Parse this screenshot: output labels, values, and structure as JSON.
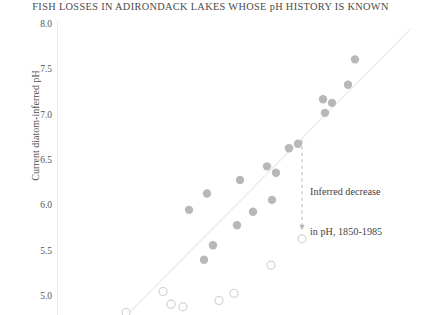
{
  "chart_data": {
    "type": "scatter",
    "title": "FISH LOSSES IN ADIRONDACK LAKES WHOSE pH HISTORY IS KNOWN",
    "xlabel": "",
    "ylabel": "Current diatom-inferred pH",
    "ylim": [
      4.75,
      8.0
    ],
    "yticks": [
      "8.0",
      "7.5",
      "7.0",
      "6.5",
      "6.0",
      "5.5",
      "5.0"
    ],
    "ytick_values": [
      8.0,
      7.5,
      7.0,
      6.5,
      6.0,
      5.5,
      5.0
    ],
    "grid": false,
    "legend": "none",
    "reference_line": {
      "label": "1:1 reference line",
      "color": "#ededed",
      "x_start_px": 125,
      "y_start_ph": 4.78,
      "x_end_px": 410,
      "y_end_ph": 7.95
    },
    "series": [
      {
        "name": "Lakes with fish present",
        "marker": "filled-circle",
        "color": "#b8b8b8",
        "points": [
          {
            "x_px": 354,
            "ph": 7.61
          },
          {
            "x_px": 347,
            "ph": 7.33
          },
          {
            "x_px": 331,
            "ph": 7.13
          },
          {
            "x_px": 322,
            "ph": 7.17
          },
          {
            "x_px": 324,
            "ph": 7.02
          },
          {
            "x_px": 297,
            "ph": 6.68
          },
          {
            "x_px": 288,
            "ph": 6.63
          },
          {
            "x_px": 266,
            "ph": 6.43
          },
          {
            "x_px": 275,
            "ph": 6.36
          },
          {
            "x_px": 239,
            "ph": 6.28
          },
          {
            "x_px": 271,
            "ph": 6.06
          },
          {
            "x_px": 206,
            "ph": 6.13
          },
          {
            "x_px": 252,
            "ph": 5.93
          },
          {
            "x_px": 188,
            "ph": 5.95
          },
          {
            "x_px": 236,
            "ph": 5.78
          },
          {
            "x_px": 212,
            "ph": 5.56
          },
          {
            "x_px": 203,
            "ph": 5.4
          }
        ]
      },
      {
        "name": "Lakes with fish losses",
        "marker": "open-circle",
        "color": "#cfcfcf",
        "points": [
          {
            "x_px": 301,
            "ph": 5.63
          },
          {
            "x_px": 270,
            "ph": 5.34
          },
          {
            "x_px": 233,
            "ph": 5.03
          },
          {
            "x_px": 218,
            "ph": 4.95
          },
          {
            "x_px": 162,
            "ph": 5.05
          },
          {
            "x_px": 170,
            "ph": 4.91
          },
          {
            "x_px": 182,
            "ph": 4.88
          },
          {
            "x_px": 125,
            "ph": 4.82
          }
        ]
      }
    ],
    "annotations": [
      {
        "name": "inferred-decrease-callout",
        "line1": "Inferred decrease",
        "line2": "in pH, 1850-1985",
        "arrow": {
          "x_px": 301,
          "ph_top": 6.72,
          "ph_bottom": 5.73,
          "style": "dashed-down-arrow"
        }
      }
    ]
  },
  "figure": {
    "title": "FISH LOSSES IN ADIRONDACK LAKES WHOSE pH HISTORY IS KNOWN",
    "y_axis_title": "Current diatom-inferred pH",
    "y_tick_labels": [
      "8.0",
      "7.5",
      "7.0",
      "6.5",
      "6.0",
      "5.5",
      "5.0"
    ],
    "annotation_line1": "Inferred decrease",
    "annotation_line2": "in pH, 1850-1985"
  }
}
